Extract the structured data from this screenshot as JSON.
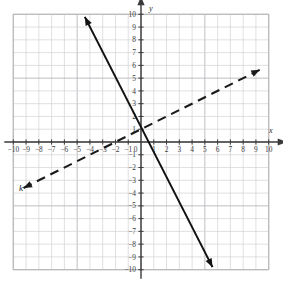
{
  "chart_data": {
    "type": "line",
    "title": "",
    "xlabel": "x",
    "ylabel": "y",
    "xlim": [
      -10,
      10
    ],
    "ylim": [
      -10,
      10
    ],
    "grid": true,
    "grid_step": 1,
    "legend": "none",
    "x_ticks": [
      "-10",
      "-9",
      "-8",
      "-7",
      "-6",
      "-5",
      "-4",
      "-3",
      "-2",
      "-1",
      "0",
      "1",
      "2",
      "3",
      "4",
      "5",
      "6",
      "7",
      "8",
      "9",
      "10"
    ],
    "y_ticks": [
      "10",
      "9",
      "8",
      "7",
      "6",
      "5",
      "4",
      "3",
      "2",
      "1",
      "-1",
      "-2",
      "-3",
      "-4",
      "-5",
      "-6",
      "-7",
      "-8",
      "-9",
      "-10"
    ],
    "series": [
      {
        "name": "solid-line",
        "style": "solid",
        "color": "#111111",
        "slope": -2,
        "intercept": 1,
        "arrows": "both",
        "start_point": [
          -4.4,
          9.8
        ],
        "end_point": [
          5.6,
          -9.8
        ],
        "label": ""
      },
      {
        "name": "dashed-line-k",
        "style": "dashed",
        "color": "#1a1a1a",
        "slope": 0.5,
        "intercept": 1,
        "arrows": "both",
        "start_point": [
          -9.2,
          -3.6
        ],
        "end_point": [
          9.3,
          5.65
        ],
        "label": "k"
      }
    ]
  },
  "axes": {
    "x_axis_label": "x",
    "y_axis_label": "y",
    "origin_label": "0"
  },
  "labels": {
    "line_k": "k"
  },
  "colors": {
    "grid": "#b9b9bd",
    "grid_minor": "#cfcfd4",
    "axis": "#3a3a3a",
    "solid_line": "#111111",
    "dashed_line": "#1a1a1a",
    "text": "#3a3a3a",
    "background": "#ffffff"
  },
  "x_tick_labels": [
    {
      "v": "-10",
      "x": -10
    },
    {
      "v": "-9",
      "x": -9
    },
    {
      "v": "-8",
      "x": -8
    },
    {
      "v": "-7",
      "x": -7
    },
    {
      "v": "-6",
      "x": -6
    },
    {
      "v": "-5",
      "x": -5
    },
    {
      "v": "-4",
      "x": -4
    },
    {
      "v": "-3",
      "x": -3
    },
    {
      "v": "-2",
      "x": -2
    },
    {
      "v": "-1",
      "x": -1
    },
    {
      "v": "0",
      "x": 0
    },
    {
      "v": "1",
      "x": 1
    },
    {
      "v": "2",
      "x": 2
    },
    {
      "v": "3",
      "x": 3
    },
    {
      "v": "4",
      "x": 4
    },
    {
      "v": "5",
      "x": 5
    },
    {
      "v": "6",
      "x": 6
    },
    {
      "v": "7",
      "x": 7
    },
    {
      "v": "8",
      "x": 8
    },
    {
      "v": "9",
      "x": 9
    },
    {
      "v": "10",
      "x": 10
    }
  ],
  "y_tick_labels": [
    {
      "v": "10",
      "y": 10
    },
    {
      "v": "9",
      "y": 9
    },
    {
      "v": "8",
      "y": 8
    },
    {
      "v": "7",
      "y": 7
    },
    {
      "v": "6",
      "y": 6
    },
    {
      "v": "5",
      "y": 5
    },
    {
      "v": "4",
      "y": 4
    },
    {
      "v": "3",
      "y": 3
    },
    {
      "v": "2",
      "y": 2
    },
    {
      "v": "1",
      "y": 1
    },
    {
      "v": "-1",
      "y": -1
    },
    {
      "v": "-2",
      "y": -2
    },
    {
      "v": "-3",
      "y": -3
    },
    {
      "v": "-4",
      "y": -4
    },
    {
      "v": "-5",
      "y": -5
    },
    {
      "v": "-6",
      "y": -6
    },
    {
      "v": "-7",
      "y": -7
    },
    {
      "v": "-8",
      "y": -8
    },
    {
      "v": "-9",
      "y": -9
    },
    {
      "v": "-10",
      "y": -10
    }
  ]
}
